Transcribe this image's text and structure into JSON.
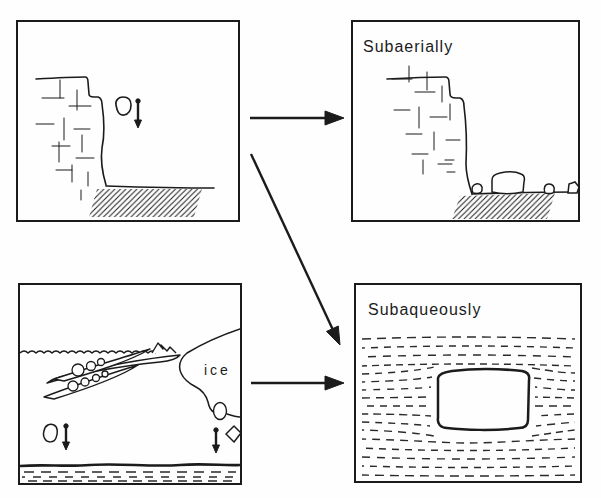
{
  "figure": {
    "background_color": "#fefefe",
    "ink_color": "#1b1b1b",
    "panels": {
      "top_left": {
        "name": "cliff rockfall source"
      },
      "top_right": {
        "label": "Subaerially"
      },
      "bottom_left": {
        "ice_label": "ice"
      },
      "bottom_right": {
        "label": "Subaqueously"
      }
    }
  }
}
